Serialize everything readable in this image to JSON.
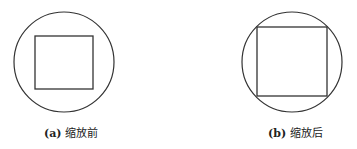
{
  "figures": [
    {
      "id": "a",
      "caption_tag": "(a)",
      "caption_text": "缩放前",
      "circle": {
        "cx": 64,
        "cy": 62,
        "r": 50
      },
      "square": {
        "x": 35,
        "y": 36,
        "w": 58,
        "h": 53
      }
    },
    {
      "id": "b",
      "caption_tag": "(b)",
      "caption_text": "缩放后",
      "circle": {
        "cx": 292,
        "cy": 62,
        "r": 50
      },
      "square": {
        "x": 257,
        "y": 27,
        "w": 70,
        "h": 69
      }
    }
  ],
  "colors": {
    "stroke": "#333333",
    "background": "#ffffff"
  }
}
